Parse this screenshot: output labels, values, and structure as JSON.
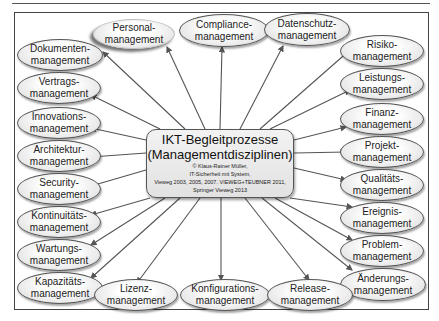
{
  "center": {
    "title_line1": "IKT-Begleitprozesse",
    "title_line2": "(Managementdisziplinen)",
    "credit_line1": "© Klaus-Rainer Müller,",
    "credit_line2": "IT-Sicherheit mit System,",
    "credit_line3": "Vieweg 2003, 2005, 2007. VIEWEG+TEUBNER 2011,",
    "credit_line4": "Springer Vieweg 2013"
  },
  "nodes": [
    {
      "id": "dokumenten",
      "line1": "Dokumenten-",
      "line2": "management"
    },
    {
      "id": "personal",
      "line1": "Personal-",
      "line2": "management"
    },
    {
      "id": "compliance",
      "line1": "Compliance-",
      "line2": "management"
    },
    {
      "id": "datenschutz",
      "line1": "Datenschutz-",
      "line2": "management"
    },
    {
      "id": "risiko",
      "line1": "Risiko-",
      "line2": "management"
    },
    {
      "id": "vertrags",
      "line1": "Vertrags-",
      "line2": "management"
    },
    {
      "id": "leistungs",
      "line1": "Leistungs-",
      "line2": "management"
    },
    {
      "id": "innovations",
      "line1": "Innovations-",
      "line2": "management"
    },
    {
      "id": "finanz",
      "line1": "Finanz-",
      "line2": "management"
    },
    {
      "id": "architektur",
      "line1": "Architektur-",
      "line2": "management"
    },
    {
      "id": "projekt",
      "line1": "Projekt-",
      "line2": "management"
    },
    {
      "id": "security",
      "line1": "Security-",
      "line2": "management"
    },
    {
      "id": "qualitaets",
      "line1": "Qualitäts-",
      "line2": "management"
    },
    {
      "id": "kontinuitaets",
      "line1": "Kontinuitäts-",
      "line2": "management"
    },
    {
      "id": "ereignis",
      "line1": "Ereignis-",
      "line2": "management"
    },
    {
      "id": "wartungs",
      "line1": "Wartungs-",
      "line2": "management"
    },
    {
      "id": "problem",
      "line1": "Problem-",
      "line2": "management"
    },
    {
      "id": "kapazitaets",
      "line1": "Kapazitäts-",
      "line2": "management"
    },
    {
      "id": "lizenz",
      "line1": "Lizenz-",
      "line2": "management"
    },
    {
      "id": "konfigurations",
      "line1": "Konfigurations-",
      "line2": "management"
    },
    {
      "id": "release",
      "line1": "Release-",
      "line2": "management"
    },
    {
      "id": "aenderungs",
      "line1": "Änderungs-",
      "line2": "management"
    }
  ]
}
